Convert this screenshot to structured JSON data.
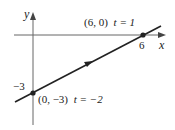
{
  "diagram": {
    "type": "parametric-line-plot",
    "axes": {
      "x_label": "x",
      "y_label": "y",
      "x_tick_label": "6",
      "y_tick_label": "−3"
    },
    "points": [
      {
        "coords_label": "(6, 0)",
        "param_label": "t = 1",
        "x": 6,
        "y": 0,
        "t": 1
      },
      {
        "coords_label": "(0, −3)",
        "param_label": "t = −2",
        "x": 0,
        "y": -3,
        "t": -2
      }
    ],
    "line": {
      "direction": "increasing t toward upper right",
      "color": "#222222"
    }
  }
}
